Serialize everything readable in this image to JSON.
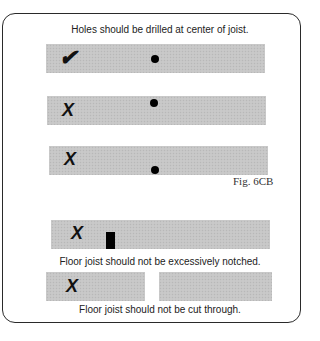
{
  "title": "Holes should be drilled at center of joist.",
  "figure_label": "Fig. 6CB",
  "joists": [
    {
      "mark": "✔",
      "mark_meaning": "correct",
      "feature": "hole",
      "hole_position": "center"
    },
    {
      "mark": "X",
      "mark_meaning": "incorrect",
      "feature": "hole",
      "hole_position": "top"
    },
    {
      "mark": "X",
      "mark_meaning": "incorrect",
      "feature": "hole",
      "hole_position": "bottom"
    },
    {
      "mark": "X",
      "mark_meaning": "incorrect",
      "feature": "notch",
      "notch_position": "bottom"
    },
    {
      "mark": "X",
      "mark_meaning": "incorrect",
      "feature": "cut-through"
    }
  ],
  "captions": {
    "notched": "Floor joist should not be excessively notched.",
    "cut": "Floor joist should not be cut through."
  },
  "colors": {
    "joist": "#c6c6c6",
    "ink": "#000000",
    "frame": "#2a2a2a"
  }
}
